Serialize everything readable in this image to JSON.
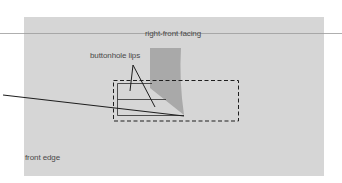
{
  "diagram": {
    "labels": {
      "facing": "right-front facing",
      "lips": "buttonhole lips",
      "edge": "front edge"
    },
    "colors": {
      "background": "#ffffff",
      "panel": "#d6d6d6",
      "facing_shape": "#a9a9a9",
      "lines": "#1e1e1e",
      "guide_line": "#9a9a9a",
      "text": "#4a4a4a"
    }
  }
}
